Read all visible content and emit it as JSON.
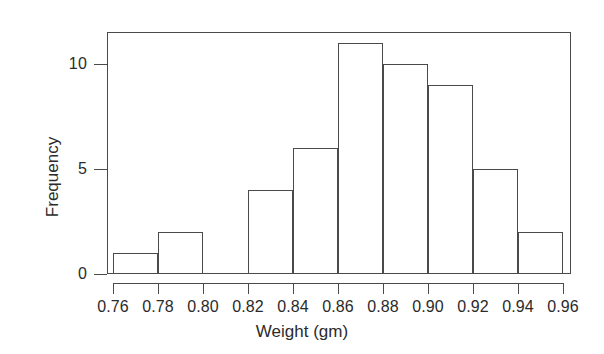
{
  "chart_data": {
    "type": "bar",
    "subtype": "histogram",
    "title": "",
    "xlabel": "Weight (gm)",
    "ylabel": "Frequency",
    "xlim": [
      0.76,
      0.96
    ],
    "ylim": [
      0,
      11.4
    ],
    "grid": false,
    "legend": null,
    "bin_width": 0.02,
    "bin_edges": [
      0.76,
      0.78,
      0.8,
      0.82,
      0.84,
      0.86,
      0.88,
      0.9,
      0.92,
      0.94,
      0.96
    ],
    "categories": [
      "0.76-0.78",
      "0.78-0.80",
      "0.80-0.82",
      "0.82-0.84",
      "0.84-0.86",
      "0.86-0.88",
      "0.88-0.90",
      "0.90-0.92",
      "0.92-0.94",
      "0.94-0.96"
    ],
    "values": [
      1,
      2,
      0,
      4,
      6,
      11,
      10,
      9,
      5,
      2
    ],
    "bins": [
      {
        "start": 0.76,
        "end": 0.78,
        "count": 1
      },
      {
        "start": 0.78,
        "end": 0.8,
        "count": 2
      },
      {
        "start": 0.8,
        "end": 0.82,
        "count": 0
      },
      {
        "start": 0.82,
        "end": 0.84,
        "count": 4
      },
      {
        "start": 0.84,
        "end": 0.86,
        "count": 6
      },
      {
        "start": 0.86,
        "end": 0.88,
        "count": 11
      },
      {
        "start": 0.88,
        "end": 0.9,
        "count": 10
      },
      {
        "start": 0.9,
        "end": 0.92,
        "count": 9
      },
      {
        "start": 0.92,
        "end": 0.94,
        "count": 5
      },
      {
        "start": 0.94,
        "end": 0.96,
        "count": 2
      }
    ],
    "xticks": [
      0.76,
      0.78,
      0.8,
      0.82,
      0.84,
      0.86,
      0.88,
      0.9,
      0.92,
      0.94,
      0.96
    ],
    "xtick_labels": [
      "0.76",
      "0.78",
      "0.80",
      "0.82",
      "0.84",
      "0.86",
      "0.88",
      "0.90",
      "0.92",
      "0.94",
      "0.96"
    ],
    "yticks": [
      0,
      5,
      10
    ],
    "ytick_labels": [
      "0",
      "5",
      "10"
    ],
    "total_count": 50,
    "colors": {
      "background": "#ffffff",
      "axis": "#4a4a4a",
      "bar_edge": "#4a4a4a",
      "bar_fill": "transparent",
      "text": "#2b2b2b"
    }
  }
}
